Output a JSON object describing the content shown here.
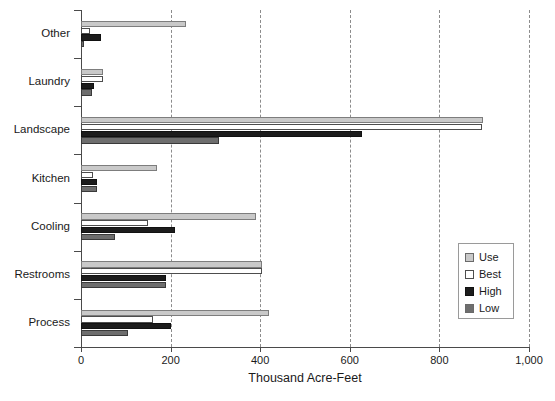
{
  "chart_data": {
    "type": "bar",
    "orientation": "horizontal",
    "title": "",
    "xlabel": "Thousand Acre-Feet",
    "ylabel": "",
    "xlim": [
      0,
      1000
    ],
    "xticks": [
      0,
      200,
      400,
      600,
      800,
      1000
    ],
    "xtick_labels": [
      "0",
      "200",
      "400",
      "600",
      "800",
      "1,000"
    ],
    "grid": "vertical-dashed",
    "legend_position": "right-middle",
    "categories": [
      "Process",
      "Restrooms",
      "Cooling",
      "Kitchen",
      "Landscape",
      "Laundry",
      "Other"
    ],
    "series": [
      {
        "name": "Use",
        "color": "#c9c9c9",
        "values": [
          420,
          405,
          390,
          170,
          897,
          50,
          235
        ]
      },
      {
        "name": "Best",
        "color": "#ffffff",
        "values": [
          160,
          405,
          150,
          27,
          895,
          48,
          20
        ]
      },
      {
        "name": "High",
        "color": "#1c1c1c",
        "values": [
          200,
          190,
          210,
          35,
          627,
          30,
          45
        ]
      },
      {
        "name": "Low",
        "color": "#6e6e6e",
        "values": [
          105,
          190,
          75,
          35,
          308,
          25,
          6
        ]
      }
    ]
  },
  "legend": {
    "items": [
      {
        "label": "Use"
      },
      {
        "label": "Best"
      },
      {
        "label": "High"
      },
      {
        "label": "Low"
      }
    ]
  },
  "axis": {
    "x_title": "Thousand Acre-Feet"
  }
}
